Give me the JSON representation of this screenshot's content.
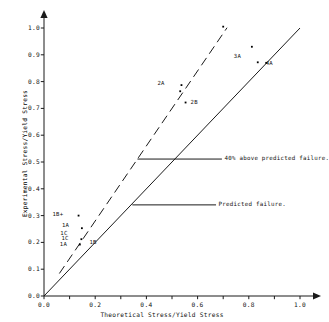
{
  "chart_data": {
    "type": "scatter",
    "title": "",
    "xlabel": "Theoretical Stress/Yield Stress",
    "ylabel": "Experimental Stress/Yield Stress",
    "xlim": [
      0.0,
      1.0
    ],
    "ylim": [
      0.0,
      1.0
    ],
    "grid": false,
    "legend": "none",
    "xticks": [
      0.0,
      0.1,
      0.2,
      0.3,
      0.4,
      0.5,
      0.6,
      0.7,
      0.8,
      0.9,
      1.0
    ],
    "xticklabels": [
      "0.0",
      "",
      "0.2",
      "",
      "0.4",
      "",
      "0.6",
      "",
      "0.8",
      "",
      "1.0"
    ],
    "yticks": [
      0.0,
      0.1,
      0.2,
      0.3,
      0.4,
      0.5,
      0.6,
      0.7,
      0.8,
      0.9,
      1.0
    ],
    "yticklabels": [
      "0.0",
      "0.1",
      "0.2",
      "0.3",
      "0.4",
      "0.5",
      "0.6",
      "0.7",
      "0.8",
      "0.9",
      "1.0"
    ],
    "axis_arrows": true,
    "series": [
      {
        "name": "specimens",
        "marker": "dot",
        "color": "#000000",
        "points": [
          {
            "label": "1B+",
            "x": 0.135,
            "y": 0.3,
            "label_dx": -26,
            "label_dy": -1,
            "show_marker": true
          },
          {
            "label": "1A",
            "x": 0.148,
            "y": 0.253,
            "label_dx": -20,
            "label_dy": -2,
            "show_marker": true
          },
          {
            "label": "1C",
            "x": 0.142,
            "y": 0.232,
            "label_dx": -20,
            "label_dy": 0,
            "show_marker": false
          },
          {
            "label": "1C",
            "x": 0.146,
            "y": 0.212,
            "label_dx": -20,
            "label_dy": 0,
            "show_marker": true
          },
          {
            "label": "1B",
            "x": 0.158,
            "y": 0.208,
            "label_dx": 5,
            "label_dy": 3,
            "show_marker": false
          },
          {
            "label": "1A",
            "x": 0.14,
            "y": 0.192,
            "label_dx": -20,
            "label_dy": 0,
            "show_marker": true
          },
          {
            "label": "2A",
            "x": 0.537,
            "y": 0.787,
            "label_dx": -24,
            "label_dy": -1,
            "show_marker": true
          },
          {
            "label": "",
            "x": 0.532,
            "y": 0.764,
            "label_dx": 0,
            "label_dy": 0,
            "show_marker": true
          },
          {
            "label": "2B",
            "x": 0.553,
            "y": 0.722,
            "label_dx": 5,
            "label_dy": 0,
            "show_marker": true
          },
          {
            "label": "",
            "x": 0.7,
            "y": 1.005,
            "label_dx": 0,
            "label_dy": 0,
            "show_marker": true
          },
          {
            "label": "3A",
            "x": 0.812,
            "y": 0.93,
            "label_dx": -18,
            "label_dy": 10,
            "show_marker": true
          },
          {
            "label": "4A",
            "x": 0.835,
            "y": 0.872,
            "label_dx": 8,
            "label_dy": 2,
            "show_marker": true
          },
          {
            "label": "",
            "x": 0.868,
            "y": 0.87,
            "label_dx": 0,
            "label_dy": 0,
            "show_marker": true
          }
        ]
      }
    ],
    "reference_lines": [
      {
        "name": "predicted-failure",
        "style": "solid",
        "slope": 1.0,
        "intercept": 0.0,
        "x_from": 0.0,
        "x_to": 1.0
      },
      {
        "name": "forty-percent-above",
        "style": "dashed",
        "slope": 1.4,
        "intercept": 0.0,
        "x_from": 0.06,
        "x_to": 0.715
      }
    ],
    "annotations": [
      {
        "name": "forty-percent-above-predicted-failure",
        "text": "40% above predicted failure.",
        "leader_from": {
          "x": 0.365,
          "y": 0.511
        },
        "leader_to": {
          "x": 0.695,
          "y": 0.511
        },
        "text_at": {
          "x": 0.705,
          "y": 0.511
        }
      },
      {
        "name": "predicted-failure",
        "text": "Predicted failure.",
        "leader_from": {
          "x": 0.345,
          "y": 0.34
        },
        "leader_to": {
          "x": 0.672,
          "y": 0.34
        },
        "text_at": {
          "x": 0.682,
          "y": 0.34
        }
      }
    ]
  }
}
